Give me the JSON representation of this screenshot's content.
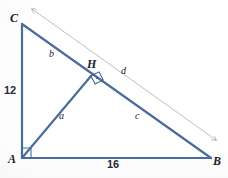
{
  "figure": {
    "type": "geometry-diagram",
    "colors": {
      "triangle_stroke": "#4a6d9e",
      "auxiliary_line": "#b3b3b3",
      "label_text": "#1a1a2e",
      "measure_text": "#2a2a3a",
      "background": "#ffffff"
    },
    "vertices": [
      {
        "name": "C",
        "label": "C",
        "x": 22,
        "y": 24
      },
      {
        "name": "H",
        "label": "H",
        "x": 91,
        "y": 76
      },
      {
        "name": "A",
        "label": "A",
        "x": 22,
        "y": 158
      },
      {
        "name": "B",
        "label": "B",
        "x": 211,
        "y": 158
      }
    ],
    "vertex_labels": [
      {
        "id": "label-C",
        "text": "C",
        "x": 10,
        "y": 12
      },
      {
        "id": "label-H",
        "text": "H",
        "x": 87,
        "y": 59
      },
      {
        "id": "label-A",
        "text": "A",
        "x": 8,
        "y": 154
      },
      {
        "id": "label-B",
        "text": "B",
        "x": 213,
        "y": 156
      }
    ],
    "segment_labels": [
      {
        "id": "label-b",
        "text": "b",
        "x": 49,
        "y": 50,
        "segment": "C-H"
      },
      {
        "id": "label-a",
        "text": "a",
        "x": 59,
        "y": 111,
        "segment": "A-H"
      },
      {
        "id": "label-c",
        "text": "c",
        "x": 135,
        "y": 111,
        "segment": "H-B"
      },
      {
        "id": "label-d",
        "text": "d",
        "x": 121,
        "y": 67,
        "segment": "auxiliary C-B"
      }
    ],
    "measures": [
      {
        "id": "measure-12",
        "text": "12",
        "x": 4,
        "y": 85,
        "side": "A-C"
      },
      {
        "id": "measure-16",
        "text": "16",
        "x": 107,
        "y": 160,
        "side": "A-B"
      }
    ],
    "right_angles": [
      {
        "id": "right-angle-A",
        "at": "A",
        "x": 22,
        "y": 158
      },
      {
        "id": "right-angle-H",
        "at": "H",
        "x": 91,
        "y": 76
      }
    ]
  }
}
